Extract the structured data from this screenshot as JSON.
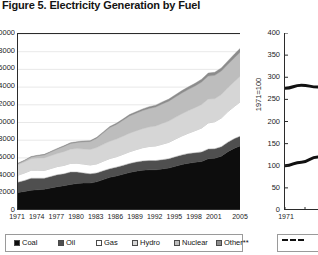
{
  "figure": {
    "title": "Figure 5. Electricity Generation by Fuel"
  },
  "chart_data": [
    {
      "id": "electricity-generation-area",
      "type": "area",
      "stacked": true,
      "title": "Electricity Generation by Fuel",
      "xlabel": "",
      "ylabel": "",
      "grid": true,
      "legend_position": "bottom",
      "ylim": [
        0,
        20000
      ],
      "ytick_labels": [
        "20000",
        "18000",
        "16000",
        "14000",
        "12000",
        "10000",
        "8000",
        "6000",
        "4000",
        "2000",
        "0"
      ],
      "ytick_values": [
        20000,
        18000,
        16000,
        14000,
        12000,
        10000,
        8000,
        6000,
        4000,
        2000,
        0
      ],
      "xtick_labels": [
        "1971",
        "1974",
        "1977",
        "1980",
        "1983",
        "1986",
        "1989",
        "1992",
        "1995",
        "1998",
        "2001",
        "2005"
      ],
      "x": [
        1971,
        1972,
        1973,
        1974,
        1975,
        1976,
        1977,
        1978,
        1979,
        1980,
        1981,
        1982,
        1983,
        1984,
        1985,
        1986,
        1987,
        1988,
        1989,
        1990,
        1991,
        1992,
        1993,
        1994,
        1995,
        1996,
        1997,
        1998,
        1999,
        2000,
        2001,
        2002,
        2003,
        2004,
        2005
      ],
      "series": [
        {
          "name": "Coal",
          "color": "#0d0d0d",
          "values": [
            2100,
            2200,
            2350,
            2400,
            2450,
            2600,
            2750,
            2850,
            3000,
            3100,
            3150,
            3150,
            3300,
            3550,
            3800,
            3950,
            4150,
            4350,
            4500,
            4600,
            4650,
            4650,
            4750,
            4850,
            5050,
            5250,
            5400,
            5500,
            5600,
            5900,
            5950,
            6200,
            6700,
            7100,
            7400
          ]
        },
        {
          "name": "Oil",
          "color": "#4f4f4f",
          "values": [
            1150,
            1250,
            1350,
            1300,
            1250,
            1300,
            1350,
            1350,
            1400,
            1300,
            1150,
            1050,
            1000,
            1000,
            980,
            1000,
            1000,
            1020,
            1030,
            1050,
            1060,
            1050,
            1050,
            1060,
            1080,
            1090,
            1100,
            1080,
            1080,
            1100,
            1080,
            1060,
            1080,
            1080,
            1100
          ]
        },
        {
          "name": "Gas",
          "color": "#ffffff",
          "values": [
            800,
            850,
            900,
            900,
            880,
            900,
            920,
            950,
            980,
            1000,
            1000,
            1000,
            1020,
            1080,
            1150,
            1180,
            1250,
            1320,
            1400,
            1500,
            1580,
            1650,
            1750,
            1850,
            2000,
            2150,
            2300,
            2500,
            2700,
            2950,
            3050,
            3250,
            3450,
            3650,
            3900
          ]
        },
        {
          "name": "Hydro",
          "color": "#d6d6d6",
          "values": [
            1200,
            1250,
            1300,
            1380,
            1420,
            1450,
            1480,
            1550,
            1600,
            1650,
            1700,
            1750,
            1850,
            1900,
            1950,
            2000,
            2050,
            2100,
            2120,
            2150,
            2200,
            2250,
            2350,
            2400,
            2450,
            2500,
            2550,
            2600,
            2650,
            2700,
            2600,
            2650,
            2700,
            2800,
            2900
          ]
        },
        {
          "name": "Nuclear",
          "color": "#bdbdbd",
          "values": [
            110,
            150,
            200,
            260,
            340,
            420,
            500,
            600,
            650,
            700,
            820,
            900,
            1050,
            1300,
            1550,
            1650,
            1800,
            1950,
            2000,
            2050,
            2100,
            2150,
            2200,
            2250,
            2300,
            2350,
            2400,
            2450,
            2550,
            2600,
            2650,
            2650,
            2650,
            2700,
            2750
          ]
        },
        {
          "name": "Other**",
          "color": "#8c8c8c",
          "values": [
            40,
            45,
            50,
            55,
            60,
            65,
            70,
            75,
            80,
            85,
            90,
            95,
            100,
            110,
            120,
            130,
            140,
            155,
            165,
            180,
            195,
            210,
            225,
            240,
            255,
            270,
            285,
            300,
            315,
            330,
            345,
            360,
            380,
            400,
            420
          ]
        }
      ],
      "legend": [
        {
          "label": "Coal",
          "color": "#0d0d0d"
        },
        {
          "label": "Oil",
          "color": "#4f4f4f"
        },
        {
          "label": "Gas",
          "color": "#ffffff"
        },
        {
          "label": "Hydro",
          "color": "#d6d6d6"
        },
        {
          "label": "Nuclear",
          "color": "#bdbdbd"
        },
        {
          "label": "Other**",
          "color": "#8c8c8c"
        }
      ]
    },
    {
      "id": "index-line-chart",
      "type": "line",
      "title": "",
      "xlabel": "",
      "ylabel": "1971=100",
      "grid": false,
      "legend_position": "bottom",
      "ylim": [
        0,
        400
      ],
      "ytick_labels": [
        "400",
        "350",
        "300",
        "250",
        "200",
        "150",
        "100",
        "50",
        "0"
      ],
      "ytick_values": [
        400,
        350,
        300,
        250,
        200,
        150,
        100,
        50,
        0
      ],
      "xtick_labels": [
        "1971"
      ],
      "x": [
        1971,
        1974,
        1977,
        1980,
        1983,
        1986
      ],
      "series": [
        {
          "name": "upper-curve",
          "style": "solid",
          "color": "#111111",
          "values": [
            275,
            282,
            278,
            262,
            240,
            215
          ]
        },
        {
          "name": "lower-curve",
          "style": "solid",
          "color": "#111111",
          "values": [
            100,
            108,
            120,
            134,
            150,
            168
          ]
        }
      ],
      "legend": [
        {
          "label": "",
          "style": "dashed",
          "color": "#111111"
        }
      ]
    }
  ]
}
